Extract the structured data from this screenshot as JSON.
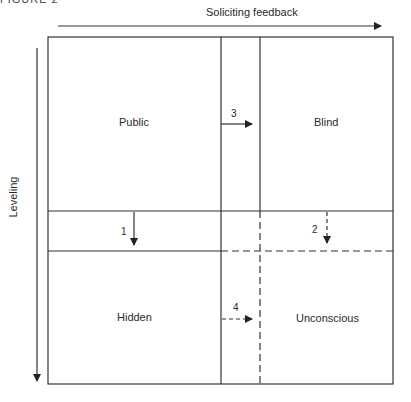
{
  "figure_label": "FIGURE 2",
  "axes": {
    "top_arrow_label": "Soliciting feedback",
    "left_arrow_label": "Leveling"
  },
  "quadrants": {
    "top_left": "Public",
    "top_right": "Blind",
    "bottom_left": "Hidden",
    "bottom_right": "Unconscious"
  },
  "arrows": {
    "a1": "1",
    "a2": "2",
    "a3": "3",
    "a4": "4"
  },
  "colors": {
    "line": "#333333",
    "background": "#ffffff"
  }
}
